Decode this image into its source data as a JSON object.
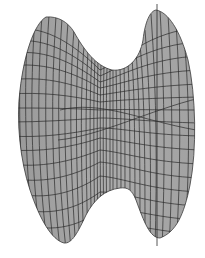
{
  "figure": {
    "description": "Shaded 3D wireframe surface (saddle-shaped hourglass) with axis line",
    "surface_fill": "#a6a6a6",
    "grid_color": "#2b2b2b",
    "background": "#ffffff"
  }
}
